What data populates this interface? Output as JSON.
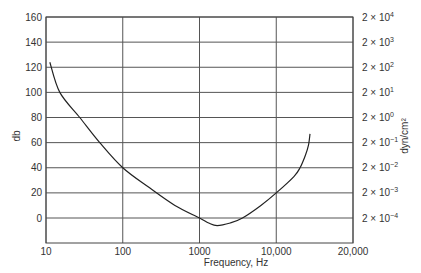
{
  "chart_data": {
    "type": "line",
    "title": "",
    "xlabel": "Frequency, Hz",
    "ylabel": "db",
    "y2label": "dyn/cm²",
    "x_scale": "log (drawn with equal spacing per tick)",
    "x_ticks": [
      "10",
      "100",
      "1000",
      "10,000",
      "20,000"
    ],
    "y_ticks": [
      0,
      20,
      40,
      60,
      80,
      100,
      120,
      140,
      160
    ],
    "ylim": [
      -20,
      160
    ],
    "y2_ticks": [
      {
        "base": "2 × 10",
        "exp": "−4"
      },
      {
        "base": "2 × 10",
        "exp": "−3"
      },
      {
        "base": "2 × 10",
        "exp": "−2"
      },
      {
        "base": "2 × 10",
        "exp": "−1"
      },
      {
        "base": "2 × 10",
        "exp": "0"
      },
      {
        "base": "2 × 10",
        "exp": "1"
      },
      {
        "base": "2 × 10",
        "exp": "2"
      },
      {
        "base": "2 × 10",
        "exp": "3"
      },
      {
        "base": "2 × 10",
        "exp": "4"
      }
    ],
    "grid": true,
    "series": [
      {
        "name": "threshold curve",
        "points": [
          {
            "tick_pos": 0.05,
            "db": 124
          },
          {
            "tick_pos": 0.18,
            "db": 100
          },
          {
            "tick_pos": 0.44,
            "db": 80
          },
          {
            "tick_pos": 0.7,
            "db": 60
          },
          {
            "tick_pos": 1.0,
            "db": 40
          },
          {
            "tick_pos": 1.35,
            "db": 24
          },
          {
            "tick_pos": 1.68,
            "db": 10
          },
          {
            "tick_pos": 2.0,
            "db": 0
          },
          {
            "tick_pos": 2.12,
            "db": -4
          },
          {
            "tick_pos": 2.23,
            "db": -6
          },
          {
            "tick_pos": 2.4,
            "db": -4
          },
          {
            "tick_pos": 2.56,
            "db": 0
          },
          {
            "tick_pos": 2.8,
            "db": 10
          },
          {
            "tick_pos": 3.0,
            "db": 20
          },
          {
            "tick_pos": 3.23,
            "db": 33
          },
          {
            "tick_pos": 3.31,
            "db": 40
          },
          {
            "tick_pos": 3.38,
            "db": 50
          },
          {
            "tick_pos": 3.42,
            "db": 58
          },
          {
            "tick_pos": 3.44,
            "db": 67
          }
        ]
      }
    ]
  }
}
